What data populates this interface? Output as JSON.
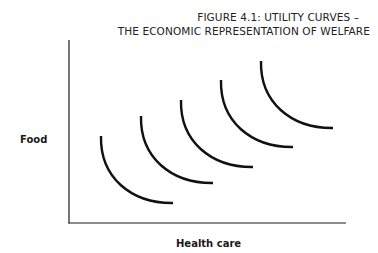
{
  "title": {
    "line1": "FIGURE 4.1:  UTILITY CURVES –",
    "line2": "THE ECONOMIC REPRESENTATION OF WELFARE"
  },
  "axes": {
    "x_label": "Health care",
    "y_label": "Food"
  },
  "chart_data": {
    "type": "diagram",
    "xlabel": "Health care",
    "ylabel": "Food",
    "grid": false,
    "ticks": false,
    "curves": [
      {
        "name": "utility curve 1",
        "start": [
          101,
          136
        ],
        "end": [
          173,
          203
        ]
      },
      {
        "name": "utility curve 2",
        "start": [
          141,
          116
        ],
        "end": [
          213,
          183
        ]
      },
      {
        "name": "utility curve 3",
        "start": [
          181,
          100
        ],
        "end": [
          253,
          167
        ]
      },
      {
        "name": "utility curve 4",
        "start": [
          221,
          80
        ],
        "end": [
          293,
          147
        ]
      },
      {
        "name": "utility curve 5",
        "start": [
          261,
          61
        ],
        "end": [
          333,
          128
        ]
      }
    ]
  }
}
